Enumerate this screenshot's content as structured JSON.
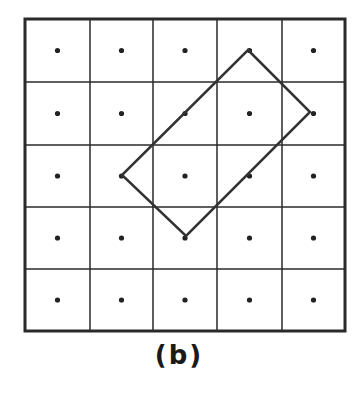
{
  "figure": {
    "caption": "(b)",
    "grid": {
      "rows": 5,
      "cols": 5,
      "x_lines": [
        25,
        90,
        153,
        217,
        282,
        345
      ],
      "y_lines": [
        19,
        82,
        145,
        207,
        269,
        331
      ],
      "line_color": "#2a2a2a",
      "border_width": 3,
      "inner_width": 1.5
    },
    "dots": {
      "show_cell_centers": true,
      "radius": 2.6,
      "color": "#222222"
    },
    "polygon": {
      "shape": "rectangle (tilted 45°)",
      "vertices_cells": [
        [
          3,
          0
        ],
        [
          4,
          1
        ],
        [
          2,
          3
        ],
        [
          1,
          2
        ]
      ],
      "vertices_px": [
        [
          248,
          50
        ],
        [
          310,
          112
        ],
        [
          186,
          236
        ],
        [
          122,
          175
        ]
      ],
      "stroke": "#333333",
      "stroke_width": 2.5
    }
  }
}
